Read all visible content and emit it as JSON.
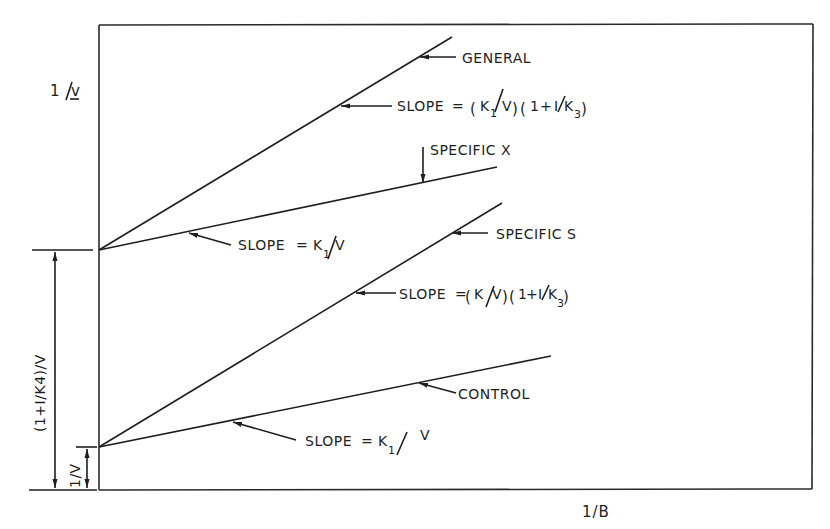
{
  "diagram": {
    "axes": {
      "y_label": "1/v",
      "x_label": "1/B"
    },
    "intercepts": {
      "upper_label": "(1+I/K4)/V",
      "lower_label": "1/V"
    },
    "lines": [
      {
        "name": "GENERAL",
        "slope_label": "SLOPE = (K1/V)(1 + I/K3)",
        "intercept": "upper"
      },
      {
        "name": "SPECIFIC X",
        "slope_label": "SLOPE = K1/V",
        "intercept": "upper"
      },
      {
        "name": "SPECIFIC S",
        "slope_label": "SLOPE = (K1/V)(1 + I/K3)",
        "intercept": "lower"
      },
      {
        "name": "CONTROL",
        "slope_label": "SLOPE = K1 / V",
        "intercept": "lower"
      }
    ],
    "text": {
      "y_axis_1": "1",
      "y_axis_slash": "/",
      "y_axis_v": "v",
      "x_axis": "1/B",
      "general": "GENERAL",
      "specific_x": "SPECIFIC X",
      "specific_s": "SPECIFIC S",
      "control": "CONTROL",
      "slope_prefix": "SLOPE",
      "eq": "=",
      "k": "K",
      "k1_sub": "1",
      "k3_sub": "3",
      "k4_sub": "4",
      "v_cap": "V",
      "one": "1",
      "plus": "+",
      "inhib": "I",
      "slash": "/",
      "lparen": "(",
      "rparen": ")",
      "upper_dim": "(1+I/K4)/V",
      "lower_dim": "1/V"
    },
    "colors": {
      "ink": "#1e1e1e",
      "background": "#ffffff"
    }
  }
}
